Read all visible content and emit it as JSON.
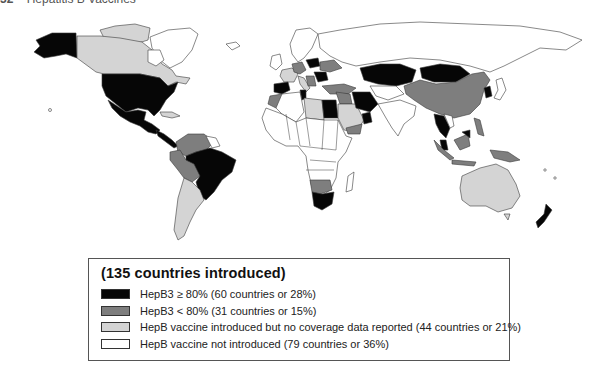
{
  "header": {
    "page_number": "32",
    "running_title": "Hepatitis B Vaccines"
  },
  "colors": {
    "hepb3_ge80": "#060606",
    "hepb3_lt80": "#7e7e7e",
    "introduced_no_data": "#d4d4d4",
    "not_introduced": "#ffffff",
    "border": "#3a3a3a"
  },
  "legend": {
    "title": "(135 countries introduced)",
    "items": [
      {
        "key": "hepb3_ge80",
        "label": "HepB3 ≥ 80% (60 countries or 28%)"
      },
      {
        "key": "hepb3_lt80",
        "label": "HepB3 < 80% (31 countries or 15%)"
      },
      {
        "key": "introduced_no_data",
        "label": "HepB vaccine introduced but no coverage data reported (44 countries or 21%)"
      },
      {
        "key": "not_introduced",
        "label": "HepB vaccine not introduced (79 countries or 36%)"
      }
    ]
  },
  "map": {
    "regions": {
      "hepb3_ge80": [
        "Alaska",
        "United States",
        "Mexico",
        "Central America",
        "Brazil",
        "Spain",
        "Poland",
        "Romania",
        "Tunisia",
        "Egypt",
        "Syria",
        "Iran",
        "Oman",
        "Kazakhstan",
        "Mongolia",
        "Korea",
        "Thailand",
        "Cambodia",
        "Malaysia",
        "Borneo (Malaysia)",
        "South Africa",
        "New Zealand"
      ],
      "hepb3_lt80": [
        "Colombia",
        "Venezuela",
        "Peru",
        "Bolivia",
        "Germany",
        "Ukraine",
        "Turkey",
        "Iraq",
        "Morocco",
        "Yemen",
        "China",
        "Indonesia",
        "Philippines",
        "Papua New Guinea",
        "Botswana/Namibia region"
      ],
      "introduced_no_data": [
        "Canada",
        "Argentina",
        "Chile",
        "Paraguay",
        "Uruguay",
        "France",
        "Italy",
        "Libya",
        "Saudi Arabia",
        "Australia"
      ],
      "not_introduced": [
        "Greenland",
        "Russia",
        "India",
        "Most of Sub-Saharan Africa",
        "Scandinavia"
      ]
    }
  }
}
